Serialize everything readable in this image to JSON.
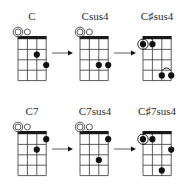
{
  "colors": {
    "line": "#4a4a4a",
    "nut": "#1a1a1a",
    "dot": "#111111",
    "label": "#2a2a2a",
    "background": "#ffffff"
  },
  "grid": {
    "strings": 4,
    "frets": 4,
    "string_spacing": 9.4,
    "fret_spacing": 10.4
  },
  "rows": [
    {
      "nut_y": 36,
      "label_y": 11,
      "chords": [
        {
          "name": "C",
          "x": 18,
          "label_x": 32,
          "open_strings": [
            1,
            2
          ],
          "root_open_string": 1,
          "dots": [
            {
              "string": 3,
              "fret": 2
            },
            {
              "string": 4,
              "fret": 3
            }
          ],
          "barres": []
        },
        {
          "name": "Csus4",
          "x": 80,
          "label_x": 95,
          "open_strings": [
            1,
            2
          ],
          "root_open_string": 1,
          "dots": [
            {
              "string": 3,
              "fret": 3
            },
            {
              "string": 4,
              "fret": 3
            }
          ],
          "barres": []
        },
        {
          "name": "C♯sus4",
          "x": 143,
          "label_x": 157,
          "open_strings": [],
          "root_open_string": null,
          "root_dot": {
            "string": 1,
            "fret": 1
          },
          "dots": [
            {
              "string": 1,
              "fret": 1
            },
            {
              "string": 2,
              "fret": 1
            },
            {
              "string": 3,
              "fret": 4
            },
            {
              "string": 4,
              "fret": 4
            }
          ],
          "barres": [
            {
              "from": 1,
              "to": 2,
              "fret": 1
            },
            {
              "from": 3,
              "to": 4,
              "fret": 4
            }
          ]
        }
      ],
      "arrows": [
        {
          "x1": 52,
          "x2": 73,
          "y": 53
        },
        {
          "x1": 114,
          "x2": 136,
          "y": 53
        }
      ]
    },
    {
      "nut_y": 131,
      "label_y": 106,
      "chords": [
        {
          "name": "C7",
          "x": 18,
          "label_x": 32,
          "open_strings": [
            1,
            2
          ],
          "root_open_string": 1,
          "dots": [
            {
              "string": 4,
              "fret": 1
            },
            {
              "string": 3,
              "fret": 2
            }
          ],
          "barres": []
        },
        {
          "name": "C7sus4",
          "x": 80,
          "label_x": 95,
          "open_strings": [
            1,
            2
          ],
          "root_open_string": 1,
          "dots": [
            {
              "string": 4,
              "fret": 1
            },
            {
              "string": 3,
              "fret": 3
            }
          ],
          "barres": []
        },
        {
          "name": "C♯7sus4",
          "x": 143,
          "label_x": 157,
          "open_strings": [],
          "root_open_string": null,
          "root_dot": {
            "string": 1,
            "fret": 1
          },
          "dots": [
            {
              "string": 1,
              "fret": 1
            },
            {
              "string": 2,
              "fret": 1
            },
            {
              "string": 4,
              "fret": 2
            },
            {
              "string": 3,
              "fret": 4
            }
          ],
          "barres": [
            {
              "from": 1,
              "to": 2,
              "fret": 1
            }
          ]
        }
      ],
      "arrows": [
        {
          "x1": 52,
          "x2": 73,
          "y": 149
        },
        {
          "x1": 114,
          "x2": 136,
          "y": 149
        }
      ]
    }
  ]
}
